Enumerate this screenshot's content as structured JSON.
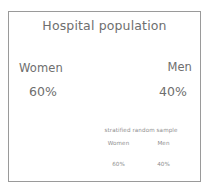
{
  "slide": {
    "title": "Hospital population",
    "border_color": "#9a9a9a",
    "text_color": "#6e6e6e",
    "muted_text_color": "#8d8d8d",
    "background_color": "#ffffff"
  },
  "population": {
    "left": {
      "label": "Women",
      "value": "60%"
    },
    "right": {
      "label": "Men",
      "value": "40%"
    }
  },
  "sample": {
    "caption": "stratified random sample",
    "headers": [
      "Women",
      "Men"
    ],
    "values": [
      "60%",
      "40%"
    ]
  },
  "chart_data": {
    "type": "table",
    "title": "Hospital population",
    "categories": [
      "Women",
      "Men"
    ],
    "series": [
      {
        "name": "Hospital population",
        "values": [
          60,
          40
        ],
        "labels": [
          "60%",
          "40%"
        ]
      },
      {
        "name": "stratified random sample",
        "values": [
          60,
          40
        ],
        "labels": [
          "60%",
          "40%"
        ]
      }
    ],
    "xlabel": "",
    "ylabel": "",
    "units": "percent",
    "annotations": [
      "stratified random sample"
    ],
    "grid": false,
    "legend": "none"
  }
}
